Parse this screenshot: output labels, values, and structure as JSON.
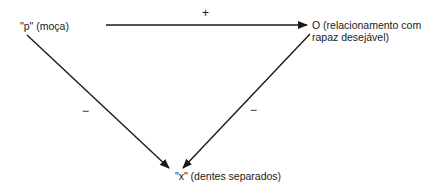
{
  "diagram": {
    "type": "balance-triangle",
    "nodes": {
      "p": {
        "label": "\"p\" (moça)"
      },
      "o": {
        "line1": "O (relacionamento com",
        "line2": "rapaz desejável)"
      },
      "x": {
        "label": "\"x\" (dentes separados)"
      }
    },
    "edges": [
      {
        "from": "p",
        "to": "o",
        "sign": "+"
      },
      {
        "from": "p",
        "to": "x",
        "sign": "−"
      },
      {
        "from": "o",
        "to": "x",
        "sign": "−"
      }
    ]
  }
}
